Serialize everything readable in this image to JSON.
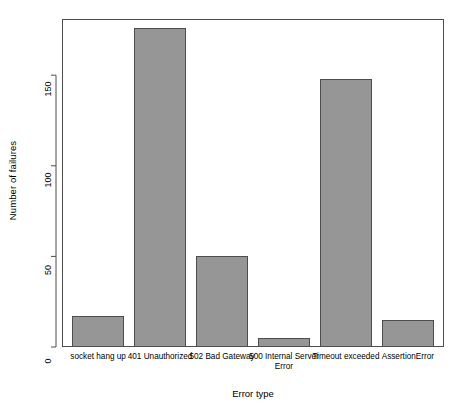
{
  "chart_data": {
    "type": "bar",
    "title": "",
    "xlabel": "Error type",
    "ylabel": "Number of failures",
    "categories": [
      "socket hang up",
      "401 Unauthorized",
      "502 Bad Gateway",
      "500 Internal Server\nError",
      "Timeout exceeded",
      "AssertionError"
    ],
    "values": [
      17,
      176,
      50,
      5,
      148,
      15
    ],
    "ylim": [
      0,
      181
    ],
    "yticks": [
      0,
      50,
      100,
      150
    ],
    "ytick_labels": [
      "0",
      "50",
      "100",
      "150"
    ],
    "grid": false,
    "legend": false,
    "bar_color": "#969696",
    "bar_border_color": "#4d4d4d",
    "axis_color": "#4d4d4d",
    "background_color": "#ffffff",
    "text_color": "#000000"
  }
}
